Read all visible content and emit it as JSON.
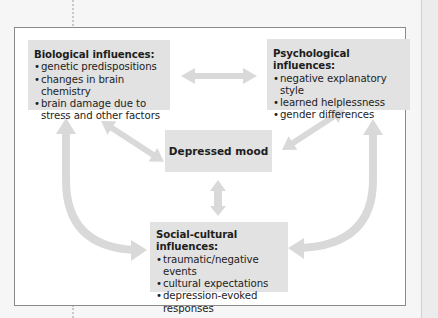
{
  "diagram": {
    "type": "influence diagram",
    "center": {
      "label": "Depressed mood"
    },
    "boxes": [
      {
        "id": "biological",
        "title": "Biological influences:",
        "items": [
          "genetic predispositions",
          "changes in brain chemistry",
          "brain damage due to stress and other factors"
        ]
      },
      {
        "id": "psychological",
        "title": "Psychological influences:",
        "items": [
          "negative explanatory style",
          "learned helplessness",
          "gender differences"
        ]
      },
      {
        "id": "social-cultural",
        "title": "Social-cultural influences:",
        "items": [
          "traumatic/negative events",
          "cultural expectations",
          "depression-evoked responses"
        ]
      }
    ],
    "connections": [
      {
        "from": "biological",
        "to": "psychological",
        "style": "straight, bidirectional"
      },
      {
        "from": "biological",
        "to": "depressed-mood",
        "style": "straight, bidirectional"
      },
      {
        "from": "psychological",
        "to": "depressed-mood",
        "style": "straight, bidirectional"
      },
      {
        "from": "social-cultural",
        "to": "depressed-mood",
        "style": "straight, bidirectional"
      },
      {
        "from": "social-cultural",
        "to": "biological",
        "style": "curved, bidirectional"
      },
      {
        "from": "social-cultural",
        "to": "psychological",
        "style": "curved, bidirectional"
      }
    ],
    "colors": {
      "box_fill": "#e2e2e2",
      "arrow": "#d9d9d9",
      "frame_border": "#8a8a8a"
    }
  }
}
